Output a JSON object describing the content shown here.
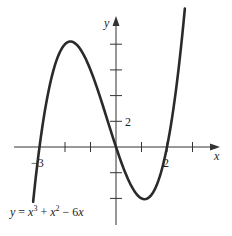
{
  "chart_data": {
    "type": "line",
    "title": "",
    "function": "y = x^3 + x^2 - 6x",
    "xlabel": "x",
    "ylabel": "y",
    "xlim": [
      -4.2,
      4.0
    ],
    "ylim": [
      -6.5,
      10.5
    ],
    "x_ticks": [
      -3,
      -2,
      -1,
      1,
      2,
      3
    ],
    "y_ticks": [
      -4,
      -2,
      2,
      4,
      6,
      8
    ],
    "x_tick_labels": [
      {
        "value": -3,
        "label": "−3"
      },
      {
        "value": 2,
        "label": "2"
      }
    ],
    "y_tick_labels": [
      {
        "value": 2,
        "label": "2"
      }
    ],
    "grid": false,
    "series": [
      {
        "name": "y = x^3 + x^2 - 6x",
        "x": [
          -3.25,
          -3,
          -2.5,
          -2,
          -1.79,
          -1.5,
          -1,
          -0.5,
          0,
          0.5,
          1,
          1.12,
          1.5,
          2,
          2.5,
          2.7
        ],
        "y": [
          -4.27,
          0,
          4.38,
          8,
          8.21,
          7.88,
          6,
          3.13,
          0,
          -2.63,
          -4,
          -4.06,
          -3.38,
          0,
          6.88,
          10.77
        ]
      }
    ],
    "annotations": [
      {
        "text": "y = x³ + x² − 6x",
        "position": "lower-left"
      }
    ]
  },
  "labels": {
    "x_axis": "x",
    "y_axis": "y",
    "tick_neg3": "−3",
    "tick_2x": "2",
    "tick_2y": "2",
    "equation_y": "y",
    "equation_eq": " = ",
    "equation_x1": "x",
    "equation_exp3": "3",
    "equation_plus": " + ",
    "equation_x2": "x",
    "equation_exp2": "2",
    "equation_minus": " − 6",
    "equation_x3": "x"
  },
  "colors": {
    "curve": "#2a2a2a",
    "axis": "#333333",
    "background": "#ffffff"
  }
}
